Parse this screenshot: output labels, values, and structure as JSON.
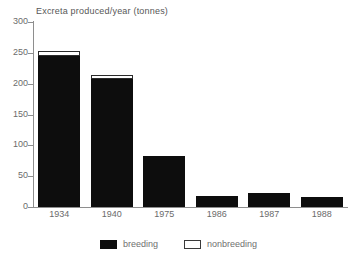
{
  "chart_data": {
    "type": "bar",
    "title": "Excreta produced/year (tonnes)",
    "xlabel": "",
    "ylabel": "",
    "ylim": [
      0,
      300
    ],
    "yticks": [
      0,
      50,
      100,
      150,
      200,
      250,
      300
    ],
    "ytick_labels": [
      "0",
      "50",
      "100",
      "150",
      "200",
      "250",
      "300"
    ],
    "grid": false,
    "stacked": true,
    "legend_position": "bottom",
    "categories": [
      "1934",
      "1940",
      "1975",
      "1986",
      "1987",
      "1988"
    ],
    "series": [
      {
        "name": "breeding",
        "color": "#0d0d0d",
        "values": [
          245,
          208,
          82,
          18,
          22,
          17
        ]
      },
      {
        "name": "nonbreeding",
        "color": "#ffffff",
        "values": [
          8,
          6,
          0,
          0,
          0,
          0
        ]
      }
    ],
    "totals": [
      253,
      214,
      82,
      18,
      22,
      17
    ]
  },
  "chart": {
    "title": "Excreta produced/year (tonnes)"
  },
  "legend": {
    "items": [
      {
        "label": "breeding",
        "swatch": "filled-black-swatch"
      },
      {
        "label": "nonbreeding",
        "swatch": "open-white-swatch"
      }
    ]
  }
}
